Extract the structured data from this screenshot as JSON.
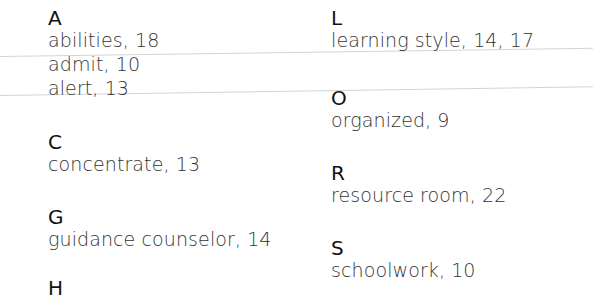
{
  "index": {
    "left_column": [
      {
        "letter": "A",
        "entries": [
          "abilities, 18",
          "admit, 10",
          "alert, 13"
        ]
      },
      {
        "letter": "C",
        "entries": [
          "concentrate, 13"
        ]
      },
      {
        "letter": "G",
        "entries": [
          "guidance counselor, 14"
        ]
      }
    ],
    "right_column": [
      {
        "letter": "L",
        "entries": [
          "learning style, 14, 17"
        ]
      },
      {
        "letter": "O",
        "entries": [
          "organized, 9"
        ]
      },
      {
        "letter": "R",
        "entries": [
          "resource room, 22"
        ]
      },
      {
        "letter": "S",
        "entries": [
          "schoolwork, 10"
        ]
      }
    ],
    "partial_letter": "H"
  }
}
